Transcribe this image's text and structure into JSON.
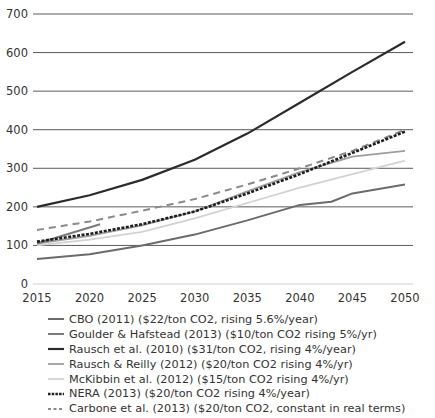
{
  "chart_data": {
    "type": "line",
    "title": "",
    "xlabel": "",
    "ylabel": "",
    "xlim": [
      2015,
      2050
    ],
    "ylim": [
      0,
      700
    ],
    "grid": true,
    "legend_position": "bottom",
    "yticks": [
      0,
      100,
      200,
      300,
      400,
      500,
      600,
      700
    ],
    "xticks": [
      2015,
      2020,
      2025,
      2030,
      2035,
      2040,
      2045,
      2050
    ],
    "series": [
      {
        "name": "CBO (2011) ($22/ton CO2, rising 5.6%/year)",
        "color": "#6b6b6b",
        "width": 2,
        "dash": "",
        "x": [
          2015,
          2020,
          2025,
          2030,
          2035,
          2040,
          2043,
          2045,
          2050
        ],
        "values": [
          65,
          77,
          100,
          128,
          165,
          205,
          213,
          235,
          258
        ]
      },
      {
        "name": "Goulder & Hafstead (2013) ($10/ton CO2 rising 5%/yr)",
        "color": "#7a7a7a",
        "width": 2,
        "dash": "",
        "x": [
          2015,
          2021
        ],
        "values": [
          105,
          155
        ]
      },
      {
        "name": "Rausch et al. (2010) ($31/ton CO2, rising 4%/year)",
        "color": "#2b2b2b",
        "width": 2.2,
        "dash": "",
        "x": [
          2015,
          2020,
          2025,
          2030,
          2035,
          2040,
          2045,
          2050
        ],
        "values": [
          200,
          230,
          270,
          322,
          390,
          470,
          550,
          628
        ]
      },
      {
        "name": "Rausch & Reilly (2012) ($20/ton CO2 rising 4%/yr)",
        "color": "#9e9e9e",
        "width": 1.8,
        "dash": "",
        "x": [
          2015,
          2020,
          2025,
          2030,
          2035,
          2040,
          2045,
          2050
        ],
        "values": [
          105,
          125,
          152,
          188,
          240,
          290,
          330,
          345
        ]
      },
      {
        "name": "McKibbin et al. (2012) ($15/ton CO2 rising 4%/yr)",
        "color": "#d2d2d2",
        "width": 1.8,
        "dash": "",
        "x": [
          2015,
          2020,
          2025,
          2030,
          2035,
          2040,
          2045,
          2050
        ],
        "values": [
          100,
          115,
          135,
          170,
          210,
          250,
          285,
          320
        ]
      },
      {
        "name": "NERA (2013) ($20/ton CO2 rising 4%/year)",
        "color": "#1e1e1e",
        "width": 2.6,
        "dash": "3,1.5",
        "x": [
          2015,
          2020,
          2025,
          2030,
          2035,
          2040,
          2045,
          2050
        ],
        "values": [
          110,
          130,
          155,
          188,
          235,
          285,
          340,
          395
        ]
      },
      {
        "name": "Carbone et al. (2013) ($20/ton CO2, constant in real terms)",
        "color": "#8a8a8a",
        "width": 2,
        "dash": "7,5",
        "x": [
          2015,
          2020,
          2025,
          2030,
          2035,
          2040,
          2045,
          2050
        ],
        "values": [
          140,
          162,
          190,
          220,
          258,
          300,
          345,
          400
        ]
      }
    ]
  },
  "layout": {
    "plot_left": 37,
    "plot_right": 405,
    "plot_top": 14,
    "plot_bottom": 284,
    "gridline_color": "#5a5a5a",
    "zero_line_color": "#cfcfcf"
  }
}
